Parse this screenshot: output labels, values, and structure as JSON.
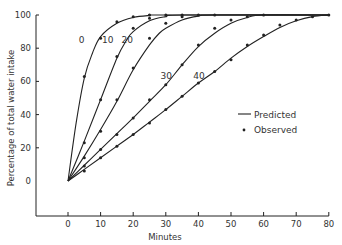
{
  "chart_data": {
    "type": "line",
    "title": "",
    "xlabel": "Minutes",
    "ylabel": "Percentage of total water intake",
    "xlim": [
      -10,
      80
    ],
    "ylim": [
      -20,
      100
    ],
    "x_ticks": [
      0,
      10,
      20,
      30,
      40,
      50,
      60,
      70,
      80
    ],
    "y_ticks": [
      0,
      20,
      40,
      60,
      80,
      100
    ],
    "grid": false,
    "legend": {
      "position": "right-middle",
      "entries": [
        {
          "label": "Predicted",
          "marker": "line"
        },
        {
          "label": "Observed",
          "marker": "dot"
        }
      ]
    },
    "series": [
      {
        "name": "0",
        "label_pos": [
          6,
          85
        ],
        "predicted": [
          [
            0,
            0
          ],
          [
            2.5,
            35
          ],
          [
            5,
            62
          ],
          [
            7.5,
            77
          ],
          [
            10,
            87
          ],
          [
            15,
            95
          ],
          [
            20,
            98.5
          ],
          [
            25,
            99.7
          ],
          [
            30,
            100
          ],
          [
            80,
            100
          ]
        ],
        "observed": [
          [
            5,
            63
          ],
          [
            10,
            86
          ],
          [
            15,
            96
          ],
          [
            20,
            99
          ],
          [
            25,
            100
          ]
        ]
      },
      {
        "name": "10",
        "label_pos": [
          14,
          85
        ],
        "predicted": [
          [
            0,
            0
          ],
          [
            5,
            24
          ],
          [
            10,
            49
          ],
          [
            15,
            74
          ],
          [
            18,
            85
          ],
          [
            20,
            90
          ],
          [
            25,
            96.5
          ],
          [
            30,
            99
          ],
          [
            35,
            100
          ],
          [
            80,
            100
          ]
        ],
        "observed": [
          [
            5,
            23
          ],
          [
            10,
            49
          ],
          [
            15,
            75
          ],
          [
            20,
            92
          ],
          [
            25,
            98
          ],
          [
            30,
            100
          ],
          [
            35,
            100
          ]
        ]
      },
      {
        "name": "20",
        "label_pos": [
          20,
          85
        ],
        "predicted": [
          [
            0,
            0
          ],
          [
            5,
            15
          ],
          [
            10,
            31
          ],
          [
            15,
            48
          ],
          [
            20,
            67
          ],
          [
            25,
            82
          ],
          [
            28,
            89
          ],
          [
            30,
            92
          ],
          [
            35,
            97
          ],
          [
            40,
            99.3
          ],
          [
            45,
            100
          ],
          [
            80,
            100
          ]
        ],
        "observed": [
          [
            5,
            14
          ],
          [
            10,
            30
          ],
          [
            15,
            49
          ],
          [
            20,
            68
          ],
          [
            25,
            86
          ],
          [
            30,
            95
          ],
          [
            35,
            99
          ],
          [
            40,
            100
          ],
          [
            45,
            100
          ]
        ]
      },
      {
        "name": "30",
        "label_pos": [
          32,
          63
        ],
        "predicted": [
          [
            0,
            0
          ],
          [
            5,
            9.5
          ],
          [
            10,
            19
          ],
          [
            15,
            28.5
          ],
          [
            20,
            38
          ],
          [
            25,
            48
          ],
          [
            30,
            58
          ],
          [
            35,
            70
          ],
          [
            40,
            81
          ],
          [
            45,
            89
          ],
          [
            50,
            95
          ],
          [
            55,
            98.5
          ],
          [
            60,
            100
          ],
          [
            80,
            100
          ]
        ],
        "observed": [
          [
            5,
            9
          ],
          [
            10,
            19
          ],
          [
            15,
            28
          ],
          [
            20,
            38
          ],
          [
            25,
            49
          ],
          [
            30,
            58
          ],
          [
            35,
            70
          ],
          [
            40,
            82
          ],
          [
            45,
            92
          ],
          [
            50,
            97
          ],
          [
            55,
            99
          ],
          [
            60,
            100
          ]
        ]
      },
      {
        "name": "40",
        "label_pos": [
          42,
          63
        ],
        "predicted": [
          [
            0,
            0
          ],
          [
            5,
            7
          ],
          [
            10,
            14
          ],
          [
            15,
            21
          ],
          [
            20,
            28
          ],
          [
            25,
            35.5
          ],
          [
            30,
            43
          ],
          [
            35,
            51
          ],
          [
            40,
            59
          ],
          [
            45,
            66
          ],
          [
            50,
            74
          ],
          [
            55,
            81
          ],
          [
            60,
            87
          ],
          [
            65,
            92.5
          ],
          [
            70,
            96.5
          ],
          [
            75,
            99
          ],
          [
            80,
            100
          ]
        ],
        "observed": [
          [
            5,
            6
          ],
          [
            10,
            14
          ],
          [
            15,
            21
          ],
          [
            20,
            28
          ],
          [
            25,
            35
          ],
          [
            30,
            43
          ],
          [
            35,
            51
          ],
          [
            40,
            59
          ],
          [
            45,
            66
          ],
          [
            50,
            73
          ],
          [
            55,
            82
          ],
          [
            60,
            88
          ],
          [
            65,
            94
          ],
          [
            70,
            97
          ],
          [
            75,
            99
          ],
          [
            80,
            100
          ]
        ]
      }
    ]
  },
  "labels": {
    "xlabel": "Minutes",
    "ylabel": "Percentage of total water intake",
    "legend_predicted": "Predicted",
    "legend_observed": "Observed"
  },
  "style": {
    "line_color": "#222222",
    "text_color": "#333333",
    "background": "#ffffff"
  }
}
